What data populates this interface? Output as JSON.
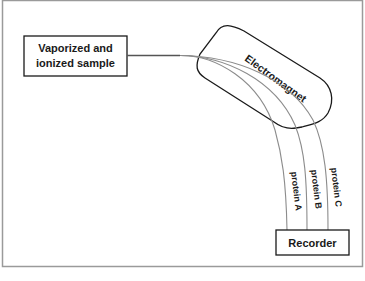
{
  "diagram": {
    "source_box": {
      "lines": [
        "Vaporized and",
        "ionized sample"
      ]
    },
    "magnet": {
      "label": "Electromagnet"
    },
    "recorder": {
      "label": "Recorder"
    },
    "beams": [
      {
        "label": "protein A"
      },
      {
        "label": "protein B"
      },
      {
        "label": "protein C"
      }
    ],
    "colors": {
      "frame": "#9a9a9a",
      "outline": "#1a1a1a",
      "beam": "#8c8c8c"
    }
  }
}
